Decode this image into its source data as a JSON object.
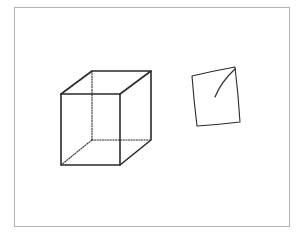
{
  "figure": {
    "frame": {
      "x": 14,
      "y": 7,
      "width": 275,
      "height": 219,
      "color": "#b4b4b4"
    },
    "stroke_color": "#2a2a2a"
  },
  "cube": {
    "vertices": {
      "front_top_left": [
        61,
        94
      ],
      "front_top_right": [
        120,
        94
      ],
      "front_bottom_left": [
        61,
        165
      ],
      "front_bottom_right": [
        120,
        165
      ],
      "back_top_left": [
        92,
        71
      ],
      "back_top_right": [
        151,
        71
      ],
      "back_bottom_left": [
        92,
        140
      ],
      "back_bottom_right": [
        151,
        140
      ]
    },
    "visible_edges": 9,
    "hidden_edges": 3
  },
  "sketch": {
    "corners": [
      [
        192,
        76
      ],
      [
        235,
        67
      ],
      [
        240,
        122
      ],
      [
        197,
        126
      ]
    ],
    "inner_stroke": {
      "from": [
        235,
        69
      ],
      "to": [
        215,
        97
      ]
    }
  }
}
